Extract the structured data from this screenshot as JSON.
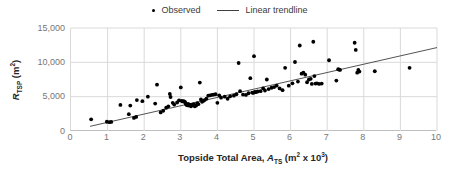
{
  "chart_data": {
    "type": "scatter",
    "title": "",
    "xlabel": "Topside Total Area, A_TS (m² x 10³)",
    "ylabel": "R_TSP (m²)",
    "xlim": [
      0,
      10
    ],
    "ylim": [
      0,
      15000
    ],
    "xticks": [
      "0",
      "1",
      "2",
      "3",
      "4",
      "5",
      "6",
      "7",
      "8",
      "9",
      "10"
    ],
    "xtick_values": [
      0,
      1,
      2,
      3,
      4,
      5,
      6,
      7,
      8,
      9,
      10
    ],
    "yticks": [
      "0",
      "5,000",
      "10,000",
      "15,000"
    ],
    "ytick_values": [
      0,
      5000,
      10000,
      15000
    ],
    "grid": "horizontal-and-vertical",
    "legend_position": "top-center",
    "series": [
      {
        "name": "Observed",
        "type": "scatter",
        "marker": "circle",
        "color": "#000000",
        "points": [
          [
            0.55,
            1700
          ],
          [
            0.98,
            1350
          ],
          [
            1.05,
            1280
          ],
          [
            1.1,
            1320
          ],
          [
            1.35,
            3800
          ],
          [
            1.58,
            2450
          ],
          [
            1.62,
            3700
          ],
          [
            1.72,
            1900
          ],
          [
            1.78,
            2050
          ],
          [
            1.8,
            4500
          ],
          [
            1.95,
            4350
          ],
          [
            2.1,
            5000
          ],
          [
            2.3,
            4000
          ],
          [
            2.35,
            6750
          ],
          [
            2.45,
            2700
          ],
          [
            2.52,
            2950
          ],
          [
            2.6,
            3400
          ],
          [
            2.66,
            3600
          ],
          [
            2.7,
            5400
          ],
          [
            2.72,
            4950
          ],
          [
            2.78,
            4100
          ],
          [
            2.82,
            3850
          ],
          [
            2.9,
            4150
          ],
          [
            2.95,
            4450
          ],
          [
            3.0,
            6350
          ],
          [
            3.02,
            4400
          ],
          [
            3.05,
            4300
          ],
          [
            3.08,
            4350
          ],
          [
            3.1,
            4250
          ],
          [
            3.12,
            4200
          ],
          [
            3.14,
            3900
          ],
          [
            3.16,
            3800
          ],
          [
            3.18,
            3750
          ],
          [
            3.2,
            3950
          ],
          [
            3.22,
            3700
          ],
          [
            3.25,
            3850
          ],
          [
            3.28,
            3600
          ],
          [
            3.3,
            3800
          ],
          [
            3.35,
            3900
          ],
          [
            3.38,
            3600
          ],
          [
            3.42,
            3700
          ],
          [
            3.45,
            4050
          ],
          [
            3.48,
            3900
          ],
          [
            3.52,
            7050
          ],
          [
            3.55,
            4600
          ],
          [
            3.58,
            4250
          ],
          [
            3.62,
            4400
          ],
          [
            3.65,
            4500
          ],
          [
            3.7,
            4700
          ],
          [
            3.75,
            5150
          ],
          [
            3.8,
            5200
          ],
          [
            3.85,
            5250
          ],
          [
            3.9,
            5300
          ],
          [
            3.95,
            5350
          ],
          [
            4.0,
            4100
          ],
          [
            4.05,
            5200
          ],
          [
            4.1,
            4850
          ],
          [
            4.2,
            5000
          ],
          [
            4.28,
            4700
          ],
          [
            4.35,
            5050
          ],
          [
            4.45,
            5150
          ],
          [
            4.52,
            5350
          ],
          [
            4.58,
            9900
          ],
          [
            4.62,
            5800
          ],
          [
            4.7,
            5300
          ],
          [
            4.78,
            5250
          ],
          [
            4.85,
            5500
          ],
          [
            4.9,
            7700
          ],
          [
            4.95,
            5600
          ],
          [
            4.98,
            5550
          ],
          [
            5.0,
            10900
          ],
          [
            5.02,
            5700
          ],
          [
            5.05,
            5650
          ],
          [
            5.1,
            5750
          ],
          [
            5.18,
            5800
          ],
          [
            5.25,
            6200
          ],
          [
            5.3,
            5900
          ],
          [
            5.35,
            7500
          ],
          [
            5.4,
            6100
          ],
          [
            5.48,
            6300
          ],
          [
            5.55,
            6400
          ],
          [
            5.62,
            6600
          ],
          [
            5.7,
            6200
          ],
          [
            5.78,
            5950
          ],
          [
            5.85,
            9200
          ],
          [
            5.95,
            6600
          ],
          [
            6.05,
            6950
          ],
          [
            6.12,
            10050
          ],
          [
            6.2,
            7200
          ],
          [
            6.25,
            12450
          ],
          [
            6.3,
            8350
          ],
          [
            6.35,
            8500
          ],
          [
            6.4,
            8200
          ],
          [
            6.45,
            7100
          ],
          [
            6.5,
            7500
          ],
          [
            6.55,
            7600
          ],
          [
            6.58,
            6850
          ],
          [
            6.62,
            13000
          ],
          [
            6.65,
            8000
          ],
          [
            6.68,
            6900
          ],
          [
            6.72,
            6950
          ],
          [
            6.78,
            6850
          ],
          [
            6.85,
            6900
          ],
          [
            7.05,
            10300
          ],
          [
            7.25,
            7350
          ],
          [
            7.3,
            9000
          ],
          [
            7.32,
            8950
          ],
          [
            7.35,
            8900
          ],
          [
            7.75,
            12850
          ],
          [
            7.78,
            11800
          ],
          [
            7.82,
            8500
          ],
          [
            7.85,
            8900
          ],
          [
            7.88,
            8650
          ],
          [
            8.3,
            8700
          ],
          [
            9.25,
            9200
          ]
        ]
      },
      {
        "name": "Linear trendline",
        "type": "line",
        "color": "#404040",
        "x_start": 0.52,
        "y_start": 680,
        "x_end": 10.0,
        "y_end": 12150
      }
    ]
  },
  "legend": {
    "entries": [
      {
        "label": "Observed",
        "marker": "dot-marker-icon"
      },
      {
        "label": "Linear trendline",
        "marker": "line-marker-icon"
      }
    ]
  },
  "axes": {
    "y_title_main": "R",
    "y_title_sub": "TSP",
    "y_title_unit_open": " (m",
    "y_title_unit_sup": "2",
    "y_title_unit_close": ")",
    "x_title_lead": "Topside Total Area, ",
    "x_title_var": "A",
    "x_title_var_sub": "TS",
    "x_title_unit_open": " (m",
    "x_title_unit_sup1": "2",
    "x_title_unit_mid": " x 10",
    "x_title_unit_sup2": "3",
    "x_title_unit_close": ")"
  },
  "colors": {
    "marker": "#000000",
    "trendline": "#404040",
    "gridline": "#d9d9d9",
    "axis": "#bfbfbf",
    "tick_text": "#767676",
    "title_text": "#262626"
  }
}
